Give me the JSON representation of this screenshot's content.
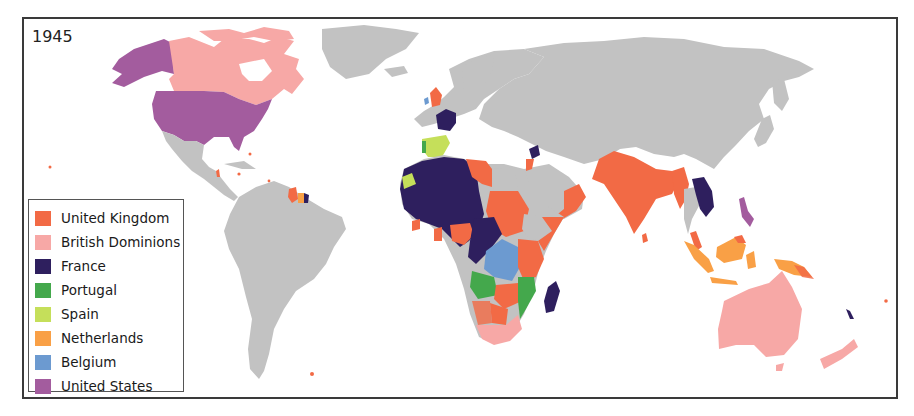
{
  "map": {
    "year_label": "1945",
    "land_color": "#c2c2c2",
    "ocean_color": "#ffffff"
  },
  "legend": {
    "items": [
      {
        "label": "United Kingdom",
        "color": "#f26a45"
      },
      {
        "label": "British Dominions",
        "color": "#f7a8a6"
      },
      {
        "label": "France",
        "color": "#2e1f5e"
      },
      {
        "label": "Portugal",
        "color": "#44a84c"
      },
      {
        "label": "Spain",
        "color": "#c5df5a"
      },
      {
        "label": "Netherlands",
        "color": "#f9a046"
      },
      {
        "label": "Belgium",
        "color": "#6c9ad0"
      },
      {
        "label": "United States",
        "color": "#a35c9e"
      }
    ]
  }
}
